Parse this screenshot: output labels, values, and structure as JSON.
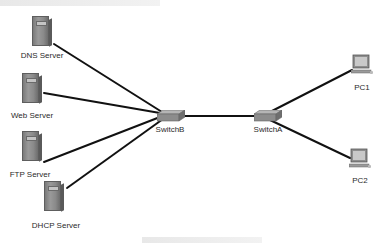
{
  "diagram": {
    "type": "network-topology",
    "nodes": [
      {
        "id": "dns",
        "label": "DNS Server",
        "kind": "server"
      },
      {
        "id": "web",
        "label": "Web Server",
        "kind": "server"
      },
      {
        "id": "ftp",
        "label": "FTP Server",
        "kind": "server"
      },
      {
        "id": "dhcp",
        "label": "DHCP Server",
        "kind": "server"
      },
      {
        "id": "switchB",
        "label": "SwitchB",
        "kind": "switch"
      },
      {
        "id": "switchA",
        "label": "SwitchA",
        "kind": "switch"
      },
      {
        "id": "pc1",
        "label": "PC1",
        "kind": "pc"
      },
      {
        "id": "pc2",
        "label": "PC2",
        "kind": "pc"
      }
    ],
    "edges": [
      {
        "from": "dns",
        "to": "switchB"
      },
      {
        "from": "web",
        "to": "switchB"
      },
      {
        "from": "ftp",
        "to": "switchB"
      },
      {
        "from": "dhcp",
        "to": "switchB"
      },
      {
        "from": "switchB",
        "to": "switchA"
      },
      {
        "from": "switchA",
        "to": "pc1"
      },
      {
        "from": "switchA",
        "to": "pc2"
      }
    ],
    "colors": {
      "link": "#111111",
      "device": "#8a8a8a",
      "label": "#2a2a2a"
    }
  }
}
